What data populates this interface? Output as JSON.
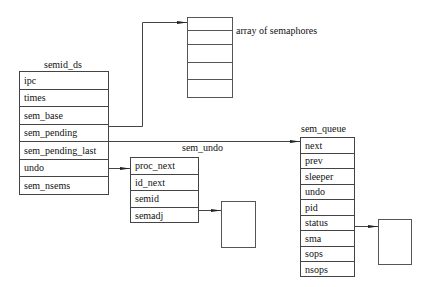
{
  "diagram": {
    "semid_ds": {
      "title": "semid_ds",
      "fields": [
        "ipc",
        "times",
        "sem_base",
        "sem_pending",
        "sem_pending_last",
        "undo",
        "sem_nsems"
      ]
    },
    "sem_undo": {
      "title": "sem_undo",
      "fields": [
        "proc_next",
        "id_next",
        "semid",
        "semadj"
      ]
    },
    "sem_queue": {
      "title": "sem_queue",
      "fields": [
        "next",
        "prev",
        "sleeper",
        "undo",
        "pid",
        "status",
        "sma",
        "sops",
        "nsops"
      ]
    },
    "semaphore_array": {
      "label": "array of semaphores",
      "cells": 5
    },
    "arrows": [
      {
        "from": "semid_ds.sem_base",
        "to": "semaphore_array"
      },
      {
        "from": "semid_ds.sem_pending",
        "to": "sem_queue.next"
      },
      {
        "from": "semid_ds.undo",
        "to": "sem_undo.proc_next"
      },
      {
        "from": "sem_undo.semadj",
        "to": "semadj-array"
      },
      {
        "from": "sem_queue.status",
        "to": "sops-array"
      }
    ],
    "colors": {
      "line": "#444444",
      "background": "#ffffff"
    }
  }
}
